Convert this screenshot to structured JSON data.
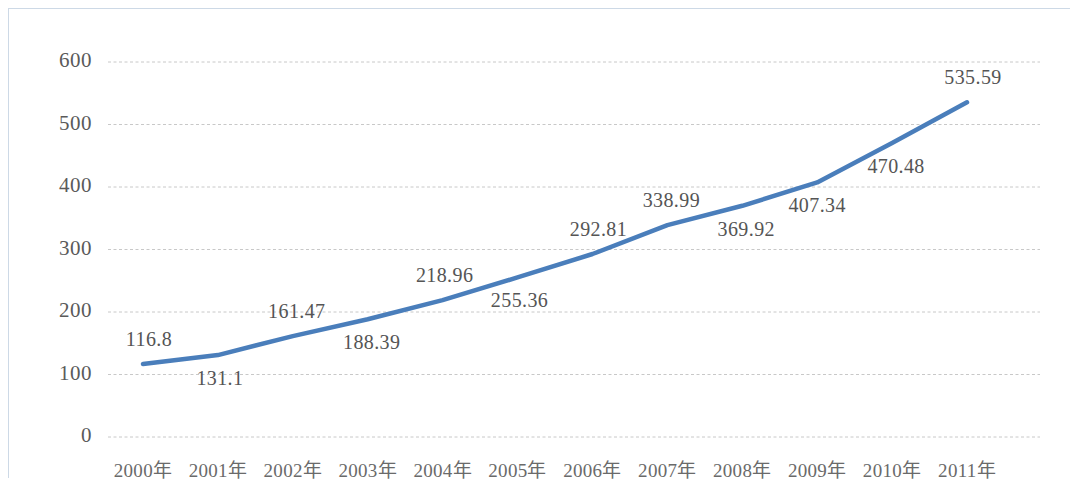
{
  "chart_data": {
    "type": "line",
    "title": "",
    "subtitle": "",
    "xlabel": "",
    "ylabel": "",
    "categories": [
      "2000年",
      "2001年",
      "2002年",
      "2003年",
      "2004年",
      "2005年",
      "2006年",
      "2007年",
      "2008年",
      "2009年",
      "2010年",
      "2011年"
    ],
    "values": [
      116.8,
      131.1,
      161.47,
      188.39,
      218.96,
      255.36,
      292.81,
      338.99,
      369.92,
      407.34,
      470.48,
      535.59
    ],
    "data_labels": [
      "116.8",
      "131.1",
      "161.47",
      "188.39",
      "218.96",
      "255.36",
      "292.81",
      "338.99",
      "369.92",
      "407.34",
      "470.48",
      "535.59"
    ],
    "label_positions": [
      "above",
      "below",
      "above",
      "below",
      "above",
      "below",
      "above",
      "above",
      "below",
      "below",
      "below",
      "above"
    ],
    "y_ticks": [
      "0",
      "100",
      "200",
      "300",
      "400",
      "500",
      "600"
    ],
    "y_tick_values": [
      0,
      100,
      200,
      300,
      400,
      500,
      600
    ],
    "ylim": [
      0,
      600
    ],
    "grid": true,
    "grid_style": "dashed",
    "legend": "none",
    "series": [
      {
        "name": "",
        "values": [
          116.8,
          131.1,
          161.47,
          188.39,
          218.96,
          255.36,
          292.81,
          338.99,
          369.92,
          407.34,
          470.48,
          535.59
        ]
      }
    ],
    "colors": {
      "line": "#4a7ebb",
      "grid": "#c8c8c8",
      "tick_text": "#5a5a5a",
      "label_text": "#555555",
      "frame_border": "#cdd9e6",
      "background": "#ffffff"
    }
  }
}
